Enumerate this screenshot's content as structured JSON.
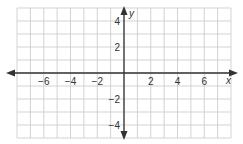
{
  "chart_data": {
    "type": "coordinate-grid",
    "title": "",
    "xlabel": "x",
    "ylabel": "y",
    "xlim": [
      -8,
      8
    ],
    "ylim": [
      -5,
      5
    ],
    "grid": true,
    "grid_step": 1,
    "x_tick_labels": [
      "-6",
      "-4",
      "-2",
      "2",
      "4",
      "6"
    ],
    "x_tick_values": [
      -6,
      -4,
      -2,
      2,
      4,
      6
    ],
    "y_tick_labels": [
      "4",
      "2",
      "-2",
      "-4"
    ],
    "y_tick_values": [
      4,
      2,
      -2,
      -4
    ]
  },
  "axes": {
    "x_label": "x",
    "y_label": "y",
    "x_ticks": [
      {
        "label": "−6",
        "value": -6
      },
      {
        "label": "−4",
        "value": -4
      },
      {
        "label": "−2",
        "value": -2
      },
      {
        "label": "2",
        "value": 2
      },
      {
        "label": "4",
        "value": 4
      },
      {
        "label": "6",
        "value": 6
      }
    ],
    "y_ticks": [
      {
        "label": "4",
        "value": 4
      },
      {
        "label": "2",
        "value": 2
      },
      {
        "label": "−2",
        "value": -2
      },
      {
        "label": "−4",
        "value": -4
      }
    ]
  },
  "colors": {
    "grid": "#c8c8c8",
    "axis": "#333333",
    "background": "#ffffff"
  }
}
